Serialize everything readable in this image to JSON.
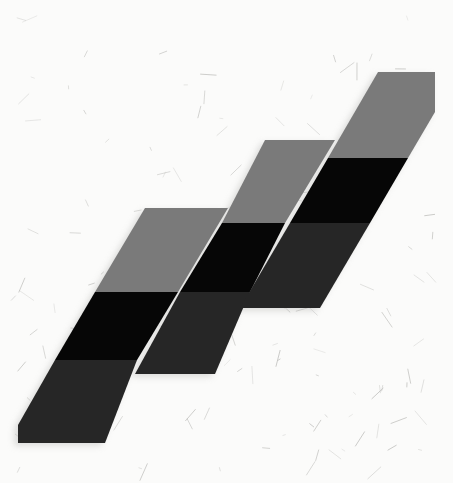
{
  "image": {
    "description": "Photograph of a quilt block: three staggered diagonal strips of parallelogram fabric pieces in light gray, black and charcoal on fibrous handmade paper",
    "background_color": "#fbfbfa",
    "fiber_color": "#9a9a96",
    "colors": {
      "gray": "#7a7a7a",
      "black": "#060606",
      "charcoal": "#262626"
    }
  },
  "strips": [
    {
      "name": "left-strip",
      "bands": [
        {
          "color": "gray",
          "points": "145,208 228,208 178,292 95,292"
        },
        {
          "color": "black",
          "points": "95,292 178,292 137,360 55,360"
        },
        {
          "color": "charcoal",
          "points": "55,360 137,360 105,443 18,443 18,425"
        }
      ]
    },
    {
      "name": "middle-strip",
      "bands": [
        {
          "color": "gray",
          "points": "265,140 335,140 285,223 222,223"
        },
        {
          "color": "black",
          "points": "222,223 285,223 250,292 180,292"
        },
        {
          "color": "charcoal",
          "points": "180,292 250,292 215,374 135,374"
        }
      ]
    },
    {
      "name": "right-strip",
      "bands": [
        {
          "color": "gray",
          "points": "378,72 435,72 435,112 408,158 328,158"
        },
        {
          "color": "black",
          "points": "328,158 408,158 370,223 290,223"
        },
        {
          "color": "charcoal",
          "points": "290,223 370,223 320,308 240,308"
        }
      ]
    }
  ]
}
